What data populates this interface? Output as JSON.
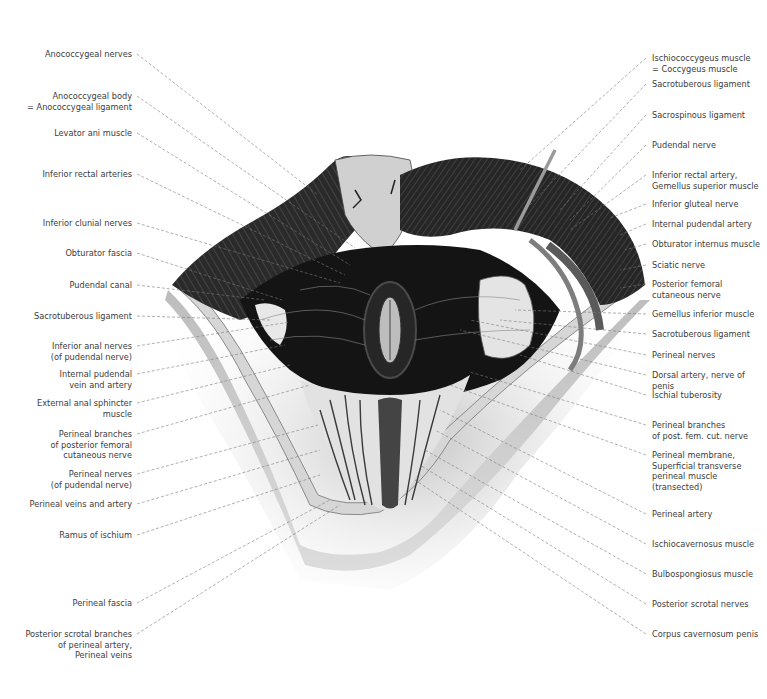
{
  "figure": {
    "left_labels": [
      {
        "text": "Anococcygeal nerves",
        "x": 132,
        "y": 54,
        "tx": 318,
        "ty": 195
      },
      {
        "text": "Anococcygeal body\n= Anococcygeal ligament",
        "x": 132,
        "y": 96,
        "tx": 355,
        "ty": 248
      },
      {
        "text": "Levator ani muscle",
        "x": 132,
        "y": 133,
        "tx": 350,
        "ty": 265
      },
      {
        "text": "Inferior rectal arteries",
        "x": 132,
        "y": 174,
        "tx": 345,
        "ty": 275
      },
      {
        "text": "Inferior clunial nerves",
        "x": 132,
        "y": 223,
        "tx": 340,
        "ty": 283
      },
      {
        "text": "Obturator fascia",
        "x": 132,
        "y": 253,
        "tx": 282,
        "ty": 300
      },
      {
        "text": "Pudendal canal",
        "x": 132,
        "y": 285,
        "tx": 265,
        "ty": 300
      },
      {
        "text": "Sacrotuberous ligament",
        "x": 132,
        "y": 316,
        "tx": 270,
        "ty": 320
      },
      {
        "text": "Inferior anal nerves\n(of pudendal nerve)",
        "x": 132,
        "y": 346,
        "tx": 290,
        "ty": 322
      },
      {
        "text": "Internal pudendal\nvein and artery",
        "x": 132,
        "y": 374,
        "tx": 285,
        "ty": 345
      },
      {
        "text": "External anal sphincter\nmuscle",
        "x": 132,
        "y": 403,
        "tx": 290,
        "ty": 365
      },
      {
        "text": "Perineal branches\nof posterior femoral\ncutaneous nerve",
        "x": 132,
        "y": 434,
        "tx": 310,
        "ty": 385
      },
      {
        "text": "Perineal nerves\n(of pudendal nerve)",
        "x": 132,
        "y": 474,
        "tx": 318,
        "ty": 425
      },
      {
        "text": "Perineal veins and artery",
        "x": 132,
        "y": 504,
        "tx": 320,
        "ty": 450
      },
      {
        "text": "Ramus of ischium",
        "x": 132,
        "y": 535,
        "tx": 320,
        "ty": 475
      },
      {
        "text": "Perineal fascia",
        "x": 132,
        "y": 603,
        "tx": 330,
        "ty": 500
      },
      {
        "text": "Posterior scrotal branches\nof perineal artery,\nPerineal veins",
        "x": 132,
        "y": 634,
        "tx": 340,
        "ty": 505
      }
    ],
    "right_labels": [
      {
        "text": "Ischiococcygeus muscle\n= Coccygeus muscle",
        "x": 652,
        "y": 58,
        "tx": 520,
        "ty": 170
      },
      {
        "text": "Sacrotuberous ligament",
        "x": 652,
        "y": 84,
        "tx": 530,
        "ty": 205
      },
      {
        "text": "Sacrospinous ligament",
        "x": 652,
        "y": 115,
        "tx": 560,
        "ty": 210
      },
      {
        "text": "Pudendal nerve",
        "x": 652,
        "y": 145,
        "tx": 570,
        "ty": 220
      },
      {
        "text": "Inferior rectal artery,\nGemellus superior muscle",
        "x": 652,
        "y": 175,
        "tx": 570,
        "ty": 230
      },
      {
        "text": "Inferior gluteal nerve",
        "x": 652,
        "y": 204,
        "tx": 610,
        "ty": 218
      },
      {
        "text": "Internal pudendal artery",
        "x": 652,
        "y": 224,
        "tx": 620,
        "ty": 235
      },
      {
        "text": "Obturator internus muscle",
        "x": 652,
        "y": 244,
        "tx": 625,
        "ty": 250
      },
      {
        "text": "Sciatic nerve",
        "x": 652,
        "y": 265,
        "tx": 620,
        "ty": 270
      },
      {
        "text": "Posterior femoral\ncutaneous nerve",
        "x": 652,
        "y": 284,
        "tx": 620,
        "ty": 288
      },
      {
        "text": "Gemellus inferior muscle",
        "x": 652,
        "y": 314,
        "tx": 515,
        "ty": 310
      },
      {
        "text": "Sacrotuberous ligament",
        "x": 652,
        "y": 334,
        "tx": 500,
        "ty": 320
      },
      {
        "text": "Perineal nerves",
        "x": 652,
        "y": 355,
        "tx": 470,
        "ty": 320
      },
      {
        "text": "Dorsal artery, nerve of penis",
        "x": 652,
        "y": 375,
        "tx": 460,
        "ty": 330
      },
      {
        "text": "Ischial tuberosity",
        "x": 652,
        "y": 395,
        "tx": 520,
        "ty": 355
      },
      {
        "text": "Perineal branches\nof post. fem. cut. nerve",
        "x": 652,
        "y": 425,
        "tx": 470,
        "ty": 372
      },
      {
        "text": "Perineal membrane,\nSuperficial transverse\nperineal muscle\n(transected)",
        "x": 652,
        "y": 455,
        "tx": 450,
        "ty": 385
      },
      {
        "text": "Perineal artery",
        "x": 652,
        "y": 514,
        "tx": 440,
        "ty": 410
      },
      {
        "text": "Ischiocavernosus muscle",
        "x": 652,
        "y": 544,
        "tx": 435,
        "ty": 430
      },
      {
        "text": "Bulbospongiosus muscle",
        "x": 652,
        "y": 574,
        "tx": 425,
        "ty": 450
      },
      {
        "text": "Posterior scrotal nerves",
        "x": 652,
        "y": 604,
        "tx": 420,
        "ty": 465
      },
      {
        "text": "Corpus cavernosum penis",
        "x": 652,
        "y": 634,
        "tx": 415,
        "ty": 480
      }
    ],
    "colors": {
      "background": "#ffffff",
      "label_text": "#3c3c3c",
      "leader_line": "#7a7a7a",
      "muscle_dark": "#1e1e1e",
      "muscle_mid": "#4a4a4a",
      "skin": "#c9c9c9",
      "fascia_light": "#e6e6e6"
    }
  }
}
